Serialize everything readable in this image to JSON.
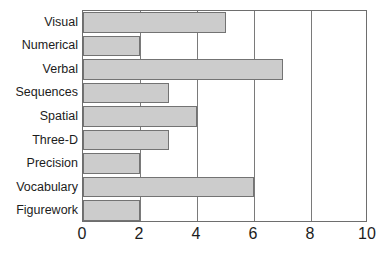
{
  "chart_data": {
    "type": "bar",
    "orientation": "horizontal",
    "title": "",
    "xlabel": "",
    "ylabel": "",
    "categories": [
      "Visual",
      "Numerical",
      "Verbal",
      "Sequences",
      "Spatial",
      "Three-D",
      "Precision",
      "Vocabulary",
      "Figurework"
    ],
    "values": [
      5,
      2,
      7,
      3,
      4,
      3,
      2,
      6,
      2
    ],
    "xlim": [
      0,
      10
    ],
    "xticks": [
      0,
      2,
      4,
      6,
      8,
      10
    ],
    "xtick_labels": [
      "0",
      "2",
      "4",
      "6",
      "8",
      "10"
    ],
    "gridlines": [
      2,
      4,
      6,
      8
    ],
    "grid": true,
    "legend": null,
    "bar_fill_color": "#cccccc",
    "bar_border_color": "#737373",
    "frame_color": "#6e6e6e",
    "background_color": "#ffffff",
    "text_color": "#1c1c1c"
  }
}
